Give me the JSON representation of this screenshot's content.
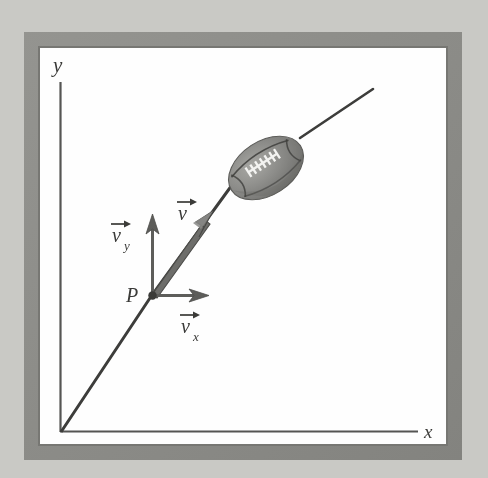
{
  "figure": {
    "kind": "physics-vector-diagram",
    "background_color": "#c9c9c5",
    "frame": {
      "band_color": "#8b8b87",
      "inner_color": "#fefefe",
      "outer": {
        "x": 24,
        "y": 32,
        "width": 438,
        "height": 428
      },
      "inner": {
        "x": 40,
        "y": 48,
        "width": 406,
        "height": 396
      }
    },
    "axes": {
      "color": "#4a4a4a",
      "origin": {
        "x": 60,
        "y": 432
      },
      "y_axis_top": {
        "x": 60,
        "y": 82
      },
      "x_axis_right": {
        "x": 418,
        "y": 432
      },
      "x_label": "x",
      "y_label": "y",
      "x_label_pos": {
        "x": 429,
        "y": 431
      },
      "y_label_pos": {
        "x": 59,
        "y": 67
      }
    },
    "trajectory": {
      "color": "#3a3a3a",
      "description": "parabolic path of football through point P"
    },
    "point": {
      "label": "P",
      "label_pos": {
        "x": 133,
        "y": 296
      },
      "position": {
        "x": 152,
        "y": 295
      },
      "dot_color": "#3a3a3a"
    },
    "vectors": [
      {
        "name": "velocity",
        "label": "v",
        "subscript": "",
        "label_pos": {
          "x": 186,
          "y": 212
        },
        "from": {
          "x": 152,
          "y": 295
        },
        "to": {
          "x": 212,
          "y": 212
        },
        "color": "#5a5a5a",
        "style": "thick-open-arrow"
      },
      {
        "name": "velocity-y-component",
        "label": "v",
        "subscript": "y",
        "label_pos": {
          "x": 123,
          "y": 236
        },
        "from": {
          "x": 152,
          "y": 295
        },
        "to": {
          "x": 152,
          "y": 215
        },
        "color": "#5a5a5a",
        "style": "open-arrow"
      },
      {
        "name": "velocity-x-component",
        "label": "v",
        "subscript": "x",
        "label_pos": {
          "x": 192,
          "y": 327
        },
        "from": {
          "x": 152,
          "y": 295
        },
        "to": {
          "x": 208,
          "y": 295
        },
        "color": "#5a5a5a",
        "style": "open-arrow"
      }
    ],
    "football": {
      "center": {
        "x": 266,
        "y": 168
      },
      "radius_x": 41,
      "radius_y": 27,
      "rotation_deg": -33,
      "body_color": "#8c8c89",
      "shade_color": "#6e6e6b",
      "highlight_color": "#a6a6a2",
      "seam_color": "#3c3c3a",
      "lace_color": "#f4f4f2",
      "lace_count": 7
    }
  }
}
